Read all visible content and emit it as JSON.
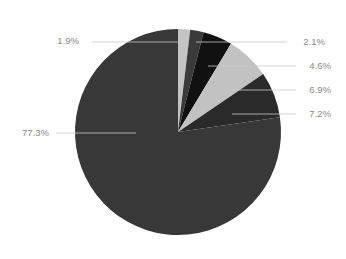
{
  "chart_data": {
    "type": "pie",
    "title": "",
    "start": "top",
    "direction": "clockwise",
    "slices": [
      {
        "label": "1.9%",
        "value": 1.9,
        "color": "#c4c4c4"
      },
      {
        "label": "2.1%",
        "value": 2.1,
        "color": "#3a3a3a"
      },
      {
        "label": "4.6%",
        "value": 4.6,
        "color": "#111111"
      },
      {
        "label": "6.9%",
        "value": 6.9,
        "color": "#c2c2c2"
      },
      {
        "label": "7.2%",
        "value": 7.2,
        "color": "#2a2a2a"
      },
      {
        "label": "77.3%",
        "value": 77.3,
        "color": "#383838"
      }
    ],
    "legend": "none",
    "label_color": "#8a8a8a",
    "leader_color": "#c8c8c8"
  }
}
